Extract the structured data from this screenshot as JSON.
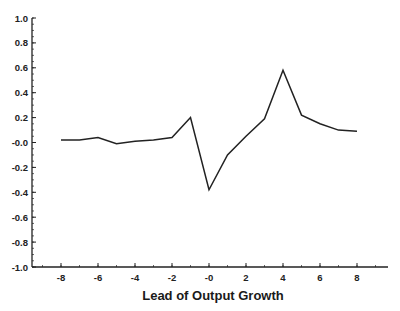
{
  "chart_data": {
    "type": "line",
    "title": "",
    "xlabel": "Lead of Output Growth",
    "ylabel": "",
    "xlim": [
      -9.5,
      9.5
    ],
    "ylim": [
      -1.0,
      1.0
    ],
    "grid": false,
    "legend": null,
    "x_ticks": [
      -8,
      -6,
      -4,
      -2,
      0,
      2,
      4,
      6,
      8
    ],
    "x_tick_labels": [
      "-8",
      "-6",
      "-4",
      "-2",
      "-0",
      "2",
      "4",
      "6",
      "8"
    ],
    "y_ticks": [
      1.0,
      0.8,
      0.6,
      0.4,
      0.2,
      0.0,
      -0.2,
      -0.4,
      -0.6,
      -0.8,
      -1.0
    ],
    "y_tick_labels": [
      "1.0",
      "0.8",
      "0.6",
      "0.4",
      "0.2",
      "-0.0",
      "-0.2",
      "-0.4",
      "-0.6",
      "-0.8",
      "-1.0"
    ],
    "x": [
      -8,
      -7,
      -6,
      -5,
      -4,
      -3,
      -2,
      -1,
      0,
      1,
      2,
      3,
      4,
      5,
      6,
      7,
      8
    ],
    "series": [
      {
        "name": "correlation",
        "color": "#222222",
        "values": [
          0.02,
          0.02,
          0.04,
          -0.01,
          0.01,
          0.02,
          0.04,
          0.2,
          -0.38,
          -0.1,
          0.05,
          0.19,
          0.58,
          0.22,
          0.15,
          0.1,
          0.09
        ]
      }
    ]
  },
  "plot": {
    "left": 32,
    "right": 388,
    "top": 18,
    "bottom": 267,
    "x0_px": 209,
    "x_px_per_unit": 18.5,
    "line_color": "#222222",
    "axis_color": "#222222"
  }
}
